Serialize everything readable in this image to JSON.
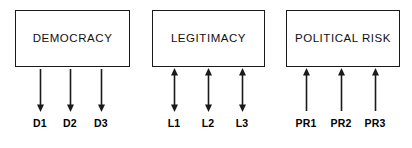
{
  "diagram": {
    "background_color": "#ffffff",
    "line_color": "#1a1a1a",
    "text_color": "#000000",
    "groups": [
      {
        "id": "democracy",
        "construct": "DEMOCRACY",
        "box": {
          "x": 15,
          "y": 10,
          "width": 115,
          "height": 57
        },
        "arrow_direction": "down",
        "arrow_positions": [
          40,
          70,
          101
        ],
        "indicators": [
          {
            "label": "D1",
            "x": 40
          },
          {
            "label": "D2",
            "x": 70
          },
          {
            "label": "D3",
            "x": 101
          }
        ]
      },
      {
        "id": "legitimacy",
        "construct": "LEGITIMACY",
        "box": {
          "x": 152,
          "y": 10,
          "width": 113,
          "height": 57
        },
        "arrow_direction": "both",
        "arrow_positions": [
          174,
          208,
          242
        ],
        "indicators": [
          {
            "label": "L1",
            "x": 174
          },
          {
            "label": "L2",
            "x": 208
          },
          {
            "label": "L3",
            "x": 242
          }
        ]
      },
      {
        "id": "political-risk",
        "construct": "POLITICAL RISK",
        "box": {
          "x": 286,
          "y": 10,
          "width": 114,
          "height": 57
        },
        "arrow_direction": "up",
        "arrow_positions": [
          306,
          341,
          375
        ],
        "indicators": [
          {
            "label": "PR1",
            "x": 306
          },
          {
            "label": "PR2",
            "x": 341
          },
          {
            "label": "PR3",
            "x": 375
          }
        ]
      }
    ]
  }
}
